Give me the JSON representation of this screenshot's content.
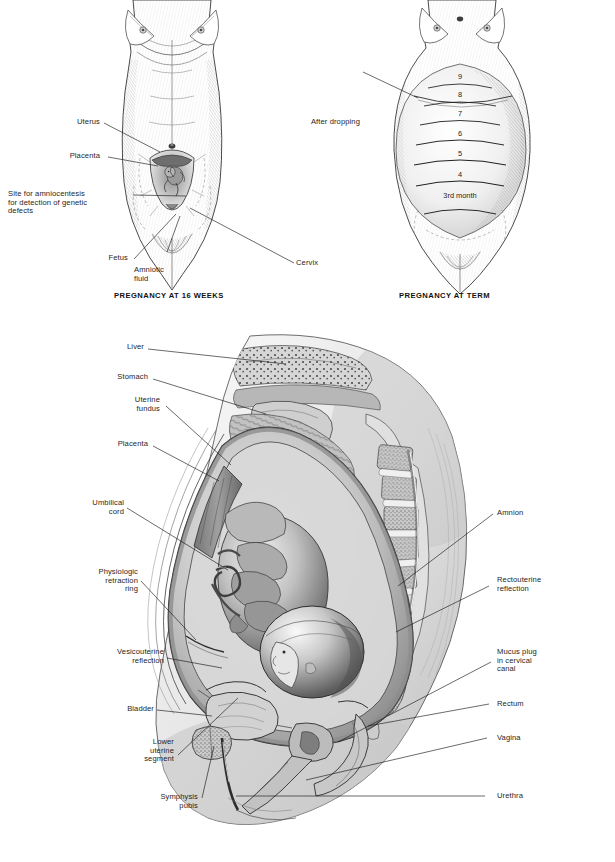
{
  "page": {
    "background": "#ffffff",
    "ink": "#1a1a1a",
    "type": "medical-anatomy-plate"
  },
  "figure_16_weeks": {
    "caption": "PREGNANCY AT 16 WEEKS",
    "view": "anterior abdominal view, female torso",
    "labels": [
      {
        "id": "uterus",
        "text": "Uterus"
      },
      {
        "id": "placenta",
        "text": "Placenta"
      },
      {
        "id": "amniocentesis",
        "text": "Site for amniocentesis\nfor detection of genetic\ndefects"
      },
      {
        "id": "fetus",
        "text": "Fetus"
      },
      {
        "id": "amniotic-fluid",
        "text": "Amniotic\nfluid"
      },
      {
        "id": "cervix",
        "text": "Cervix"
      }
    ]
  },
  "figure_term": {
    "caption": "PREGNANCY AT TERM",
    "view": "anterior abdominal view showing fundal heights by month",
    "labels": [
      {
        "id": "after-dropping",
        "text": "After dropping"
      }
    ],
    "fundal_heights": [
      {
        "month": "9"
      },
      {
        "month": "8"
      },
      {
        "month": "7"
      },
      {
        "month": "6"
      },
      {
        "month": "5"
      },
      {
        "month": "4"
      },
      {
        "month": "3rd\nmonth"
      }
    ]
  },
  "figure_sagittal": {
    "view": "midsagittal section of pregnant abdomen and pelvis at term",
    "labels_left": [
      {
        "id": "liver",
        "text": "Liver"
      },
      {
        "id": "stomach",
        "text": "Stomach"
      },
      {
        "id": "uterine-fundus",
        "text": "Uterine\nfundus"
      },
      {
        "id": "placenta",
        "text": "Placenta"
      },
      {
        "id": "umbilical-cord",
        "text": "Umbilical\ncord"
      },
      {
        "id": "physiologic-retraction-ring",
        "text": "Physiologic\nretraction\nring"
      },
      {
        "id": "vesicouterine-reflection",
        "text": "Vesicouterine\nreflection"
      },
      {
        "id": "bladder",
        "text": "Bladder"
      },
      {
        "id": "lower-uterine-segment",
        "text": "Lower\nuterine\nsegment"
      },
      {
        "id": "symphysis-pubis",
        "text": "Symphysis\npubis"
      }
    ],
    "labels_right": [
      {
        "id": "amnion",
        "text": "Amnion"
      },
      {
        "id": "rectouterine-reflection",
        "text": "Rectouterine\nreflection"
      },
      {
        "id": "mucus-plug",
        "text": "Mucus plug\nin cervical\ncanal"
      },
      {
        "id": "rectum",
        "text": "Rectum"
      },
      {
        "id": "vagina",
        "text": "Vagina"
      },
      {
        "id": "urethra",
        "text": "Urethra"
      }
    ]
  }
}
